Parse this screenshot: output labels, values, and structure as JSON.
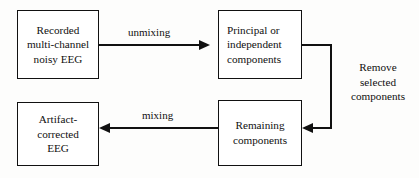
{
  "diagram": {
    "colors": {
      "background": "#fdfdfc",
      "box_fill": "#ffffff",
      "stroke": "#111111",
      "text": "#100f0f"
    },
    "nodes": [
      {
        "id": "recorded",
        "lines": [
          "Recorded",
          "multi-channel",
          "noisy EEG"
        ],
        "align": "center"
      },
      {
        "id": "components",
        "lines": [
          "Principal or",
          "independent",
          "components"
        ],
        "align": "left"
      },
      {
        "id": "artifact",
        "lines": [
          "Artifact-",
          "corrected",
          "EEG"
        ],
        "align": "center"
      },
      {
        "id": "remaining",
        "lines": [
          "Remaining",
          "components"
        ],
        "align": "center"
      }
    ],
    "edges": [
      {
        "id": "unmixing",
        "label": "unmixing",
        "from": "recorded",
        "to": "components",
        "direction": "right"
      },
      {
        "id": "mixing",
        "label": "mixing",
        "from": "remaining",
        "to": "artifact",
        "direction": "left"
      },
      {
        "id": "remove",
        "from": "components",
        "to": "remaining",
        "direction": "left"
      }
    ],
    "annotations": [
      {
        "id": "remove-selected-components",
        "lines": [
          "Remove",
          "selected",
          "components"
        ]
      }
    ]
  }
}
